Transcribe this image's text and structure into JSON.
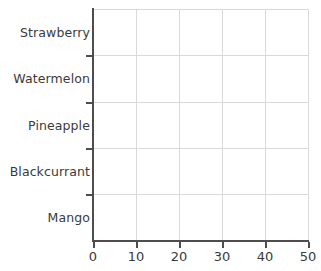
{
  "chart_data": {
    "type": "bar",
    "orientation": "horizontal",
    "title": "",
    "xlabel": "",
    "ylabel": "",
    "categories": [
      "Mango",
      "Blackcurrant",
      "Pineapple",
      "Watermelon",
      "Strawberry"
    ],
    "values": [
      null,
      null,
      null,
      null,
      null
    ],
    "xlim": [
      0,
      50
    ],
    "xticks": [
      0,
      10,
      20,
      30,
      40,
      50
    ],
    "xtick_labels": [
      "0",
      "10",
      "20",
      "30",
      "40",
      "50"
    ],
    "ytick_labels": [
      "Mango",
      "Blackcurrant",
      "Pineapple",
      "Watermelon",
      "Strawberry"
    ],
    "grid": true,
    "legend": false,
    "note": "empty plot frame - no bars drawn",
    "colors": {
      "background": "#ffffff",
      "gridline": "#d9d9d9",
      "spine": "#4d4d4d",
      "text": "#3a3a3a"
    }
  },
  "axes": {
    "y_categories": [
      {
        "label": "Strawberry",
        "center": 32
      },
      {
        "label": "Watermelon",
        "center": 78
      },
      {
        "label": "Pineapple",
        "center": 125
      },
      {
        "label": "Blackcurrant",
        "center": 171
      },
      {
        "label": "Mango",
        "center": 217
      }
    ],
    "y_tick_positions": [
      55,
      102,
      148,
      194
    ],
    "x_ticks": [
      {
        "label": "0",
        "x": 93
      },
      {
        "label": "10",
        "x": 136
      },
      {
        "label": "20",
        "x": 179
      },
      {
        "label": "30",
        "x": 222
      },
      {
        "label": "40",
        "x": 265
      },
      {
        "label": "50",
        "x": 308
      }
    ],
    "h_gridlines": [
      9,
      55,
      102,
      148,
      194
    ],
    "v_gridlines": [
      0,
      43,
      86,
      129,
      172,
      215
    ]
  }
}
